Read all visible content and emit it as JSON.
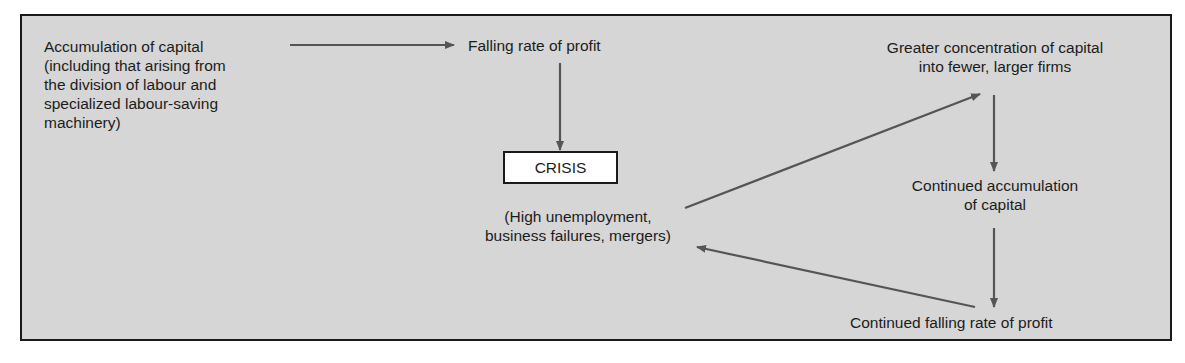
{
  "diagram": {
    "type": "flowchart",
    "nodes": {
      "accumulation": {
        "line1": "Accumulation of capital",
        "line2": "(including that arising from",
        "line3": "the division of labour and",
        "line4": "specialized labour-saving",
        "line5": "machinery)"
      },
      "falling_rate": {
        "label": "Falling rate of profit"
      },
      "crisis": {
        "label": "CRISIS"
      },
      "crisis_detail": {
        "line1": "(High unemployment,",
        "line2": "business failures, mergers)"
      },
      "concentration": {
        "line1": "Greater concentration of capital",
        "line2": "into fewer, larger firms"
      },
      "continued_accumulation": {
        "line1": "Continued accumulation",
        "line2": "of capital"
      },
      "continued_falling": {
        "label": "Continued falling rate of profit"
      }
    },
    "edges": [
      {
        "from": "accumulation",
        "to": "falling_rate"
      },
      {
        "from": "falling_rate",
        "to": "crisis"
      },
      {
        "from": "crisis_detail",
        "to": "concentration"
      },
      {
        "from": "concentration",
        "to": "continued_accumulation"
      },
      {
        "from": "continued_accumulation",
        "to": "continued_falling"
      },
      {
        "from": "continued_falling",
        "to": "crisis_detail"
      }
    ],
    "colors": {
      "background": "#d6d6d6",
      "border": "#1a1a1a",
      "arrow": "#555555",
      "crisis_box": "#ffffff"
    }
  }
}
